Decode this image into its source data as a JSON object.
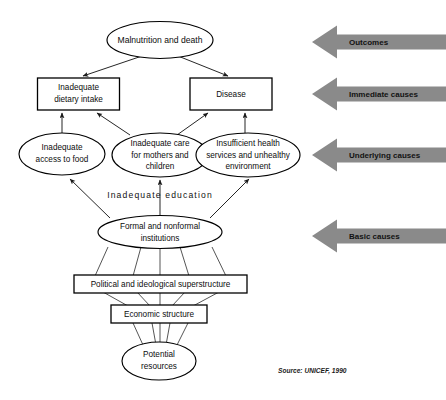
{
  "diagram": {
    "source_note": "Source: UNICEF, 1990",
    "education_label": "Inadequate education",
    "colors": {
      "band_arrow_fill": "#8a8a8a",
      "shape_stroke": "#000000",
      "shape_fill": "#ffffff",
      "text": "#0d0d0d"
    },
    "nodes": {
      "malnutrition": "Malnutrition and death",
      "dietary_intake": "Inadequate\ndietary intake",
      "dietary_intake_line1": "Inadequate",
      "dietary_intake_line2": "dietary intake",
      "disease": "Disease",
      "access_to_food_line1": "Inadequate",
      "access_to_food_line2": "access to food",
      "care_line1": "Inadequate care",
      "care_line2": "for mothers and",
      "care_line3": "children",
      "health_services_line1": "Insufficient health",
      "health_services_line2": "services and unhealthy",
      "health_services_line3": "environment",
      "institutions_line1": "Formal and nonformal",
      "institutions_line2": "institutions",
      "superstructure": "Political and ideological superstructure",
      "economic_structure": "Economic structure",
      "potential_resources_line1": "Potential",
      "potential_resources_line2": "resources"
    },
    "bands": [
      {
        "label": "Outcomes"
      },
      {
        "label": "Immediate causes"
      },
      {
        "label": "Underlying causes"
      },
      {
        "label": "Basic causes"
      }
    ]
  }
}
